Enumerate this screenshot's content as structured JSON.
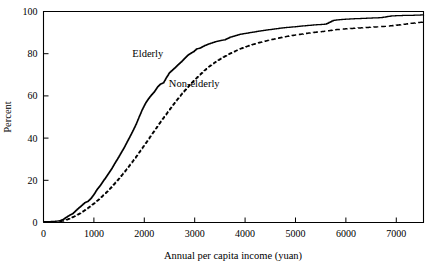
{
  "chart_data": {
    "type": "line",
    "title": "",
    "subtitle": "",
    "xlabel": "Annual per capita income (yuan)",
    "ylabel": "Percent",
    "xlim": [
      0,
      7540
    ],
    "ylim": [
      0,
      100
    ],
    "xticks": [
      0,
      1000,
      2000,
      3000,
      4000,
      5000,
      6000,
      7000
    ],
    "xtick_labels": [
      "0",
      "1000",
      "2000",
      "3000",
      "4000",
      "5000",
      "6000",
      "7000"
    ],
    "yticks": [
      0,
      20,
      40,
      60,
      80,
      100
    ],
    "ytick_labels": [
      "0",
      "20",
      "40",
      "60",
      "80",
      "100"
    ],
    "grid": false,
    "legend_position": "inline-annotations",
    "annotations": [
      {
        "text": "Elderly",
        "x": 2070,
        "y": 78.5
      },
      {
        "text": "Non-elderly",
        "x": 2990,
        "y": 64.0
      }
    ],
    "series": [
      {
        "name": "Elderly",
        "style": "solid",
        "color": "#000000",
        "x": [
          0,
          200,
          320,
          400,
          460,
          520,
          580,
          640,
          700,
          760,
          820,
          880,
          940,
          1000,
          1060,
          1120,
          1180,
          1240,
          1300,
          1360,
          1420,
          1480,
          1540,
          1600,
          1660,
          1720,
          1780,
          1840,
          1900,
          1960,
          2020,
          2080,
          2140,
          2200,
          2260,
          2320,
          2380,
          2440,
          2500,
          2560,
          2620,
          2680,
          2740,
          2800,
          2860,
          2920,
          2980,
          3040,
          3100,
          3200,
          3300,
          3400,
          3500,
          3600,
          3700,
          3800,
          3900,
          4000,
          4150,
          4300,
          4450,
          4600,
          4800,
          5000,
          5200,
          5400,
          5600,
          5750,
          5900,
          6100,
          6300,
          6500,
          6700,
          6900,
          7100,
          7300,
          7540
        ],
        "y": [
          0.4,
          0.5,
          0.8,
          1.6,
          2.6,
          3.5,
          4.2,
          5.6,
          6.9,
          8.1,
          9.4,
          10.0,
          11.4,
          13.3,
          15.6,
          17.4,
          19.5,
          21.5,
          23.6,
          25.8,
          28.3,
          30.6,
          33.1,
          35.5,
          38.3,
          41.0,
          43.8,
          46.8,
          50.3,
          53.6,
          56.4,
          58.6,
          60.4,
          62.0,
          64.2,
          65.6,
          66.2,
          68.8,
          71.0,
          72.3,
          73.6,
          75.0,
          76.3,
          77.8,
          79.2,
          80.2,
          81.0,
          82.3,
          82.6,
          83.9,
          84.8,
          85.6,
          86.2,
          86.6,
          87.8,
          88.5,
          89.2,
          89.6,
          90.2,
          90.8,
          91.3,
          91.8,
          92.4,
          92.8,
          93.3,
          93.7,
          94.0,
          95.8,
          96.2,
          96.5,
          96.7,
          96.9,
          97.1,
          97.9,
          98.1,
          98.2,
          98.4
        ]
      },
      {
        "name": "Non-elderly",
        "style": "dashed",
        "color": "#000000",
        "x": [
          0,
          250,
          380,
          460,
          540,
          620,
          700,
          780,
          860,
          940,
          1020,
          1100,
          1180,
          1260,
          1340,
          1420,
          1500,
          1580,
          1660,
          1740,
          1820,
          1900,
          1980,
          2060,
          2140,
          2220,
          2300,
          2380,
          2460,
          2540,
          2620,
          2700,
          2780,
          2860,
          2940,
          3020,
          3100,
          3200,
          3300,
          3400,
          3500,
          3600,
          3700,
          3800,
          3900,
          4000,
          4150,
          4300,
          4450,
          4600,
          4800,
          5000,
          5200,
          5400,
          5600,
          5800,
          6000,
          6200,
          6400,
          6600,
          6800,
          7000,
          7200,
          7400,
          7540
        ],
        "y": [
          0.3,
          0.4,
          0.7,
          1.3,
          2.1,
          3.0,
          4.0,
          5.2,
          6.5,
          7.9,
          9.4,
          11.0,
          12.8,
          14.6,
          16.6,
          18.7,
          20.9,
          23.2,
          25.6,
          28.1,
          30.6,
          33.3,
          36.0,
          38.7,
          41.5,
          44.2,
          47.0,
          49.6,
          52.2,
          54.8,
          57.3,
          59.7,
          62.0,
          64.1,
          66.2,
          68.1,
          70.0,
          72.2,
          74.2,
          75.9,
          77.4,
          78.8,
          80.1,
          81.2,
          82.3,
          83.2,
          84.4,
          85.4,
          86.3,
          87.1,
          88.1,
          88.9,
          89.6,
          90.2,
          90.7,
          91.4,
          91.8,
          92.1,
          92.4,
          92.7,
          93.0,
          93.5,
          94.1,
          94.7,
          95.0
        ]
      }
    ]
  }
}
